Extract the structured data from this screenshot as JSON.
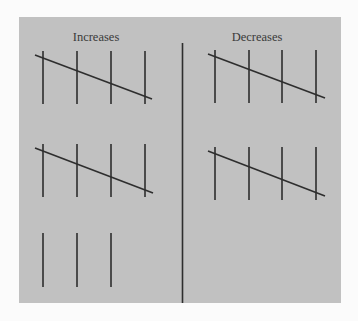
{
  "diagram": {
    "left_title": "Increases",
    "right_title": "Decreases",
    "colors": {
      "background": "#fbfbfb",
      "panel": "#c1c1c1",
      "line": "#2e2e2e",
      "text": "#3a3a3a"
    },
    "left_column": {
      "groups": [
        {
          "vertical_lines": 4,
          "crossed": true
        },
        {
          "vertical_lines": 4,
          "crossed": true
        },
        {
          "vertical_lines": 3,
          "crossed": false
        }
      ]
    },
    "right_column": {
      "groups": [
        {
          "vertical_lines": 4,
          "crossed": true
        },
        {
          "vertical_lines": 4,
          "crossed": true
        }
      ]
    }
  }
}
